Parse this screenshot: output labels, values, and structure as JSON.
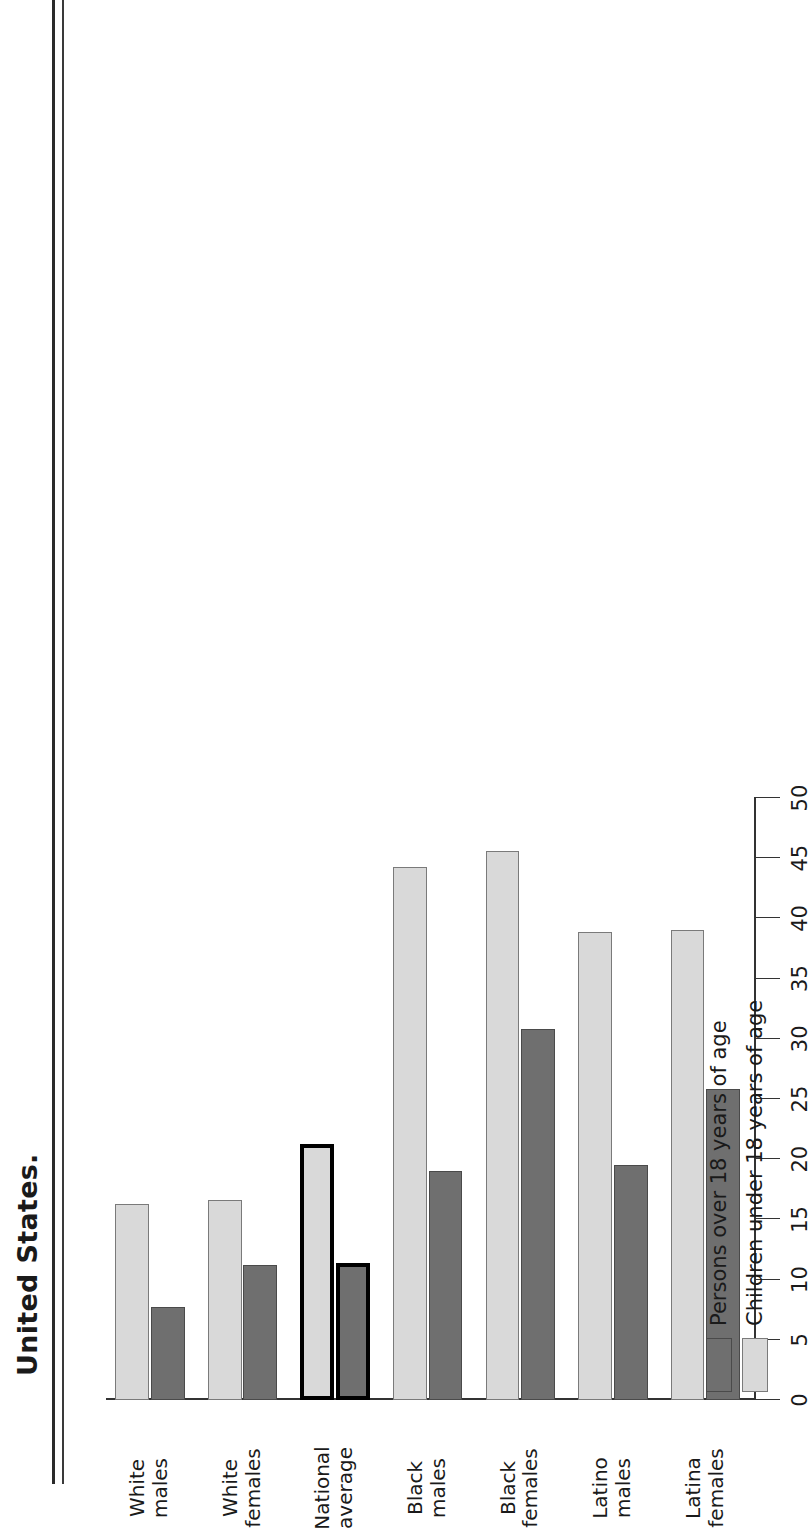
{
  "figure": {
    "title": "United States.",
    "scan_artifact": "page-edge-rule"
  },
  "legend": {
    "items": [
      {
        "key": "adults",
        "label": "Persons over 18 years of age",
        "color": "#6f6f6f"
      },
      {
        "key": "children",
        "label": "Children under 18 years of age",
        "color": "#d9d9d9"
      }
    ]
  },
  "axis": {
    "ticks": [
      "0",
      "5",
      "10",
      "15",
      "20",
      "25",
      "30",
      "35",
      "40",
      "45",
      "50"
    ],
    "min": 0,
    "max": 50,
    "step": 5
  },
  "categories": [
    {
      "line1": "White",
      "line2": "males"
    },
    {
      "line1": "White",
      "line2": "females"
    },
    {
      "line1": "National",
      "line2": "average"
    },
    {
      "line1": "Black",
      "line2": "males"
    },
    {
      "line1": "Black",
      "line2": "females"
    },
    {
      "line1": "Latino",
      "line2": "males"
    },
    {
      "line1": "Latina",
      "line2": "females"
    }
  ],
  "chart_data": {
    "type": "bar",
    "orientation": "horizontal",
    "title": "United States.",
    "xlabel": "",
    "ylabel": "",
    "xlim": [
      0,
      50
    ],
    "grid": false,
    "legend_position": "bottom-left",
    "highlighted_category": "National average",
    "categories": [
      "White males",
      "White females",
      "National average",
      "Black males",
      "Black females",
      "Latino males",
      "Latina females"
    ],
    "series": [
      {
        "name": "Persons over 18 years of age",
        "color": "#6f6f6f",
        "values": [
          7.7,
          11.2,
          11.4,
          19.0,
          30.8,
          19.5,
          25.8
        ]
      },
      {
        "name": "Children under 18 years of age",
        "color": "#d9d9d9",
        "values": [
          16.3,
          16.6,
          21.3,
          44.3,
          45.6,
          38.9,
          39.0
        ]
      }
    ]
  }
}
